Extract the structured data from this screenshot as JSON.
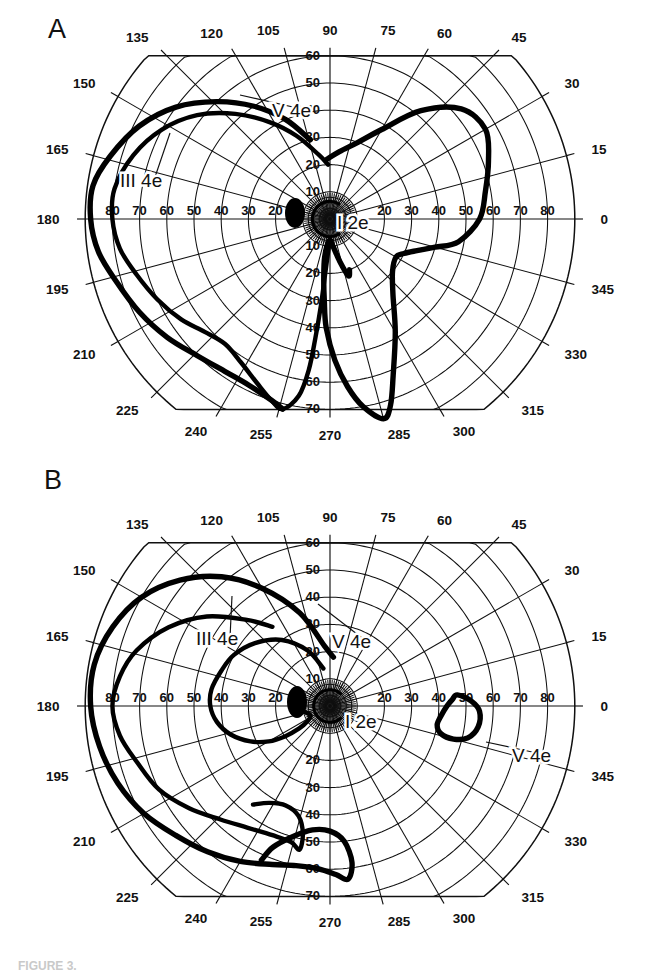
{
  "figure": {
    "width": 657,
    "height": 974,
    "background": "#ffffff",
    "ink_color": "#111111",
    "caption_fragment": "FIGURE 3."
  },
  "panels": [
    {
      "id": "A",
      "letter": "A",
      "center": {
        "x": 330,
        "y": 219
      },
      "scale_px_per_deg": 2.72,
      "grid": {
        "meridian_step_deg": 15,
        "ring_values_deg": [
          10,
          20,
          30,
          40,
          50,
          60,
          70,
          80,
          90
        ],
        "outer_ring_deg": 90,
        "flat_top_deg": 60,
        "flat_bottom_deg": 70,
        "inner_fan_rings_deg": [
          2,
          4,
          6,
          8
        ],
        "grid_visible": true
      },
      "angle_labels": [
        {
          "value": "0",
          "deg": 0
        },
        {
          "value": "15",
          "deg": 15
        },
        {
          "value": "30",
          "deg": 30
        },
        {
          "value": "45",
          "deg": 45
        },
        {
          "value": "60",
          "deg": 60
        },
        {
          "value": "75",
          "deg": 75
        },
        {
          "value": "90",
          "deg": 90
        },
        {
          "value": "105",
          "deg": 105
        },
        {
          "value": "120",
          "deg": 120
        },
        {
          "value": "135",
          "deg": 135
        },
        {
          "value": "150",
          "deg": 150
        },
        {
          "value": "165",
          "deg": 165
        },
        {
          "value": "180",
          "deg": 180
        },
        {
          "value": "195",
          "deg": 195
        },
        {
          "value": "210",
          "deg": 210
        },
        {
          "value": "225",
          "deg": 225
        },
        {
          "value": "240",
          "deg": 240
        },
        {
          "value": "255",
          "deg": 255
        },
        {
          "value": "270",
          "deg": 270
        },
        {
          "value": "285",
          "deg": 285
        },
        {
          "value": "300",
          "deg": 300
        },
        {
          "value": "315",
          "deg": 315
        },
        {
          "value": "330",
          "deg": 330
        },
        {
          "value": "345",
          "deg": 345
        }
      ],
      "radial_labels_left": [
        "20",
        "30",
        "40",
        "50",
        "60",
        "70",
        "80"
      ],
      "radial_labels_right": [
        "20",
        "30",
        "40",
        "50",
        "60",
        "70",
        "80"
      ],
      "radial_labels_up": [
        "10",
        "20",
        "30",
        "40",
        "50",
        "60"
      ],
      "radial_labels_down": [
        "10",
        "20",
        "30",
        "40",
        "50",
        "60",
        "70"
      ],
      "isopter_labels": [
        {
          "text": "III 4e",
          "x": 120,
          "y": 187,
          "leader_to": {
            "x": 170,
            "y": 133
          }
        },
        {
          "text": "V 4e",
          "x": 272,
          "y": 117,
          "leader_to": {
            "x": 240,
            "y": 95
          }
        },
        {
          "text": "I 2e",
          "x": 337,
          "y": 229,
          "leader_to": null
        }
      ],
      "blind_spot": {
        "x": 295,
        "y": 213,
        "rx": 10,
        "ry": 15
      },
      "isopters": [
        {
          "name": "V 4e",
          "stimulus": "V",
          "filter": "4e",
          "weight": "heavy",
          "points_polar_deg": [
            [
              93,
              22
            ],
            [
              82,
              25
            ],
            [
              70,
              30
            ],
            [
              60,
              38
            ],
            [
              50,
              52
            ],
            [
              40,
              63
            ],
            [
              30,
              66
            ],
            [
              20,
              62
            ],
            [
              10,
              58
            ],
            [
              0,
              55
            ],
            [
              350,
              48
            ],
            [
              345,
              40
            ],
            [
              340,
              34
            ],
            [
              335,
              30
            ],
            [
              330,
              28
            ],
            [
              320,
              30
            ],
            [
              310,
              36
            ],
            [
              300,
              48
            ],
            [
              292,
              62
            ],
            [
              288,
              72
            ],
            [
              285,
              76
            ],
            [
              280,
              70
            ],
            [
              276,
              62
            ],
            [
              272,
              52
            ],
            [
              268,
              40
            ],
            [
              266,
              30
            ],
            [
              264,
              22
            ],
            [
              262,
              14
            ],
            [
              268,
              8
            ],
            [
              276,
              10
            ],
            [
              283,
              16
            ],
            [
              288,
              22
            ],
            [
              291,
              20
            ]
          ]
        },
        {
          "name": "III 4e",
          "stimulus": "III",
          "filter": "4e",
          "weight": "mid",
          "points_polar_deg": [
            [
              92,
              20
            ],
            [
              100,
              24
            ],
            [
              112,
              33
            ],
            [
              122,
              42
            ],
            [
              132,
              52
            ],
            [
              142,
              62
            ],
            [
              152,
              70
            ],
            [
              162,
              76
            ],
            [
              172,
              80
            ],
            [
              180,
              80
            ],
            [
              188,
              78
            ],
            [
              196,
              74
            ],
            [
              205,
              70
            ],
            [
              214,
              66
            ],
            [
              222,
              62
            ],
            [
              230,
              60
            ],
            [
              238,
              62
            ],
            [
              246,
              66
            ],
            [
              252,
              70
            ],
            [
              256,
              72
            ],
            [
              260,
              66
            ],
            [
              262,
              56
            ],
            [
              263,
              44
            ],
            [
              264,
              32
            ],
            [
              265,
              20
            ],
            [
              268,
              10
            ],
            [
              274,
              8
            ]
          ]
        },
        {
          "name": "III 4e outer",
          "stimulus": "III",
          "filter": "4e",
          "weight": "heavy",
          "points_polar_deg": [
            [
              104,
              30
            ],
            [
              114,
              40
            ],
            [
              124,
              50
            ],
            [
              134,
              60
            ],
            [
              144,
              70
            ],
            [
              154,
              78
            ],
            [
              164,
              84
            ],
            [
              172,
              88
            ],
            [
              180,
              88
            ],
            [
              188,
              86
            ],
            [
              196,
              82
            ],
            [
              206,
              78
            ],
            [
              216,
              74
            ],
            [
              226,
              70
            ],
            [
              236,
              68
            ],
            [
              244,
              68
            ],
            [
              252,
              70
            ],
            [
              256,
              72
            ]
          ]
        },
        {
          "name": "I 2e",
          "stimulus": "I",
          "filter": "2e",
          "weight": "fine",
          "shape": "small-c-around-fixation",
          "radius_deg": 6.5,
          "gap_deg": [
            300,
            60
          ]
        }
      ]
    },
    {
      "id": "B",
      "letter": "B",
      "center": {
        "x": 330,
        "y": 706
      },
      "scale_px_per_deg": 2.72,
      "grid": {
        "meridian_step_deg": 15,
        "ring_values_deg": [
          10,
          20,
          30,
          40,
          50,
          60,
          70,
          80,
          90
        ],
        "outer_ring_deg": 90,
        "flat_top_deg": 60,
        "flat_bottom_deg": 70,
        "inner_fan_rings_deg": [
          2,
          4,
          6,
          8
        ],
        "grid_visible": true
      },
      "angle_labels": [
        {
          "value": "0",
          "deg": 0
        },
        {
          "value": "15",
          "deg": 15
        },
        {
          "value": "30",
          "deg": 30
        },
        {
          "value": "45",
          "deg": 45
        },
        {
          "value": "60",
          "deg": 60
        },
        {
          "value": "75",
          "deg": 75
        },
        {
          "value": "90",
          "deg": 90
        },
        {
          "value": "105",
          "deg": 105
        },
        {
          "value": "120",
          "deg": 120
        },
        {
          "value": "135",
          "deg": 135
        },
        {
          "value": "150",
          "deg": 150
        },
        {
          "value": "165",
          "deg": 165
        },
        {
          "value": "180",
          "deg": 180
        },
        {
          "value": "195",
          "deg": 195
        },
        {
          "value": "210",
          "deg": 210
        },
        {
          "value": "225",
          "deg": 225
        },
        {
          "value": "240",
          "deg": 240
        },
        {
          "value": "255",
          "deg": 255
        },
        {
          "value": "270",
          "deg": 270
        },
        {
          "value": "285",
          "deg": 285
        },
        {
          "value": "300",
          "deg": 300
        },
        {
          "value": "315",
          "deg": 315
        },
        {
          "value": "330",
          "deg": 330
        },
        {
          "value": "345",
          "deg": 345
        }
      ],
      "radial_labels_left": [
        "20",
        "30",
        "40",
        "50",
        "60",
        "70",
        "80"
      ],
      "radial_labels_right": [
        "20",
        "30",
        "40",
        "50",
        "60",
        "70",
        "80"
      ],
      "radial_labels_up": [
        "10",
        "20",
        "30",
        "40",
        "50",
        "60"
      ],
      "radial_labels_down": [
        "20",
        "30",
        "40",
        "50",
        "60",
        "70"
      ],
      "isopter_labels": [
        {
          "text": "III 4e",
          "x": 196,
          "y": 645,
          "leader_to": {
            "x": 232,
            "y": 596
          }
        },
        {
          "text": "V 4e",
          "x": 332,
          "y": 648,
          "leader_to": {
            "x": 318,
            "y": 604
          }
        },
        {
          "text": "I 2e",
          "x": 345,
          "y": 728,
          "leader_to": null
        },
        {
          "text": "V 4e",
          "x": 512,
          "y": 762,
          "leader_to": {
            "x": 486,
            "y": 742
          }
        }
      ],
      "blind_spot": {
        "x": 297,
        "y": 702,
        "rx": 10,
        "ry": 16
      },
      "isopters": [
        {
          "name": "V 4e",
          "stimulus": "V",
          "filter": "4e",
          "weight": "heavy",
          "points_polar_deg": [
            [
              86,
              18
            ],
            [
              95,
              22
            ],
            [
              108,
              36
            ],
            [
              120,
              50
            ],
            [
              130,
              62
            ],
            [
              140,
              72
            ],
            [
              150,
              80
            ],
            [
              160,
              85
            ],
            [
              170,
              88
            ],
            [
              180,
              88
            ],
            [
              190,
              86
            ],
            [
              200,
              83
            ],
            [
              210,
              79
            ],
            [
              220,
              74
            ],
            [
              230,
              70
            ],
            [
              240,
              66
            ],
            [
              250,
              62
            ],
            [
              258,
              60
            ],
            [
              266,
              60
            ],
            [
              272,
              62
            ],
            [
              276,
              64
            ],
            [
              278,
              58
            ],
            [
              276,
              50
            ],
            [
              270,
              46
            ],
            [
              262,
              46
            ],
            [
              254,
              50
            ],
            [
              248,
              56
            ],
            [
              246,
              62
            ]
          ]
        },
        {
          "name": "III 4e",
          "stimulus": "III",
          "filter": "4e",
          "weight": "mid",
          "points_polar_deg": [
            [
              126,
              36
            ],
            [
              134,
              44
            ],
            [
              144,
              56
            ],
            [
              154,
              66
            ],
            [
              164,
              74
            ],
            [
              172,
              78
            ],
            [
              180,
              80
            ],
            [
              188,
              78
            ],
            [
              196,
              74
            ],
            [
              206,
              70
            ],
            [
              216,
              64
            ],
            [
              226,
              58
            ],
            [
              236,
              54
            ],
            [
              246,
              52
            ],
            [
              254,
              52
            ],
            [
              258,
              54
            ],
            [
              258,
              48
            ],
            [
              254,
              42
            ],
            [
              246,
              40
            ],
            [
              238,
              42
            ],
            [
              232,
              46
            ]
          ]
        },
        {
          "name": "V 4e inner nasal",
          "stimulus": "V",
          "filter": "4e",
          "weight": "mid",
          "points_polar_deg": [
            [
              100,
              14
            ],
            [
              112,
              22
            ],
            [
              126,
              30
            ],
            [
              140,
              36
            ],
            [
              152,
              40
            ],
            [
              162,
              42
            ],
            [
              172,
              44
            ],
            [
              180,
              44
            ],
            [
              188,
              42
            ],
            [
              196,
              38
            ],
            [
              204,
              32
            ],
            [
              210,
              26
            ],
            [
              214,
              20
            ],
            [
              216,
              14
            ],
            [
              214,
              10
            ],
            [
              206,
              8
            ],
            [
              196,
              9
            ],
            [
              188,
              11
            ]
          ]
        },
        {
          "name": "V 4e temporal island",
          "stimulus": "V",
          "filter": "4e",
          "weight": "heavy",
          "closed": true,
          "points_polar_deg": [
            [
              5,
              47
            ],
            [
              2,
              52
            ],
            [
              358,
              55
            ],
            [
              352,
              55
            ],
            [
              347,
              52
            ],
            [
              345,
              47
            ],
            [
              346,
              42
            ],
            [
              350,
              40
            ],
            [
              355,
              41
            ],
            [
              0,
              43
            ],
            [
              3,
              45
            ]
          ]
        },
        {
          "name": "I 2e",
          "stimulus": "I",
          "filter": "2e",
          "weight": "fine",
          "shape": "small-c-around-fixation",
          "radius_deg": 6.0,
          "gap_deg": [
            310,
            50
          ]
        }
      ]
    }
  ]
}
